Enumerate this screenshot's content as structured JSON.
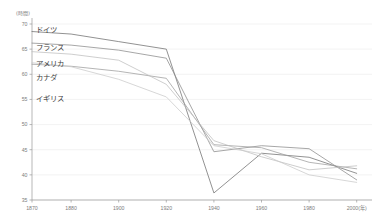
{
  "chart_data": {
    "type": "line",
    "title": "",
    "subtitle": "",
    "xlabel": "",
    "ylabel": "(時間)",
    "x_unit_suffix": "(年)",
    "xlim": [
      1870,
      2000
    ],
    "ylim": [
      35,
      70
    ],
    "grid": true,
    "legend_position": "inline-left",
    "x_ticks": [
      "1870",
      "1880",
      "1900",
      "1920",
      "1940",
      "1960",
      "1980",
      "2000"
    ],
    "x_tick_values": [
      1870,
      1880,
      1900,
      1920,
      1940,
      1960,
      1980,
      2000
    ],
    "x_last_tick_label": "2000(年)",
    "y_ticks": [
      "70",
      "65",
      "60",
      "55",
      "50",
      "45",
      "40",
      "35"
    ],
    "y_tick_values": [
      70,
      65,
      60,
      55,
      50,
      45,
      40,
      35
    ],
    "x": [
      1870,
      1880,
      1900,
      1920,
      1940,
      1960,
      1980,
      2000
    ],
    "series": [
      {
        "name": "ドイツ",
        "color": "#6e6e6e",
        "label_x": 1874,
        "label_y": 69.0,
        "values": [
          68.5,
          68.0,
          66.5,
          65.0,
          36.4,
          44.3,
          43.5,
          40.3
        ]
      },
      {
        "name": "フランス",
        "color": "#8a8a8a",
        "label_x": 1874,
        "label_y": 65.4,
        "values": [
          66.2,
          65.8,
          64.8,
          63.2,
          44.6,
          45.8,
          45.2,
          39.0
        ]
      },
      {
        "name": "アメリカ",
        "color": "#9c9c9c",
        "label_x": 1874,
        "label_y": 62.2,
        "values": [
          62.0,
          61.6,
          60.6,
          59.2,
          46.0,
          45.4,
          42.5,
          41.2
        ]
      },
      {
        "name": "カナダ",
        "color": "#bdbdbd",
        "label_x": 1874,
        "label_y": 59.4,
        "values": [
          64.5,
          64.0,
          62.8,
          58.0,
          46.8,
          43.6,
          41.0,
          41.8
        ]
      },
      {
        "name": "イギリス",
        "color": "#c9c9c9",
        "label_x": 1874,
        "label_y": 55.2,
        "values": [
          62.3,
          61.5,
          59.0,
          55.5,
          45.8,
          44.2,
          40.0,
          38.5
        ]
      }
    ]
  }
}
